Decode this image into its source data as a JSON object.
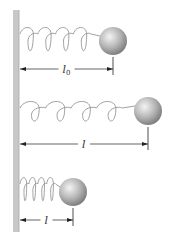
{
  "figure": {
    "colors": {
      "wall": "#c8c8c8",
      "wall_edge": "#a0a0a0",
      "spring": "#8a8a8a",
      "ball_light": "#f2f2f2",
      "ball_dark": "#7a7a7a",
      "dimension_line": "#222222"
    },
    "panels": [
      {
        "name": "natural-length",
        "label": "l",
        "label_subscript": "0",
        "spring_start_x": 20,
        "spring_end_x": 100,
        "spring_top_y": 28,
        "loops": 4,
        "ball_cx": 113,
        "ball_cy": 41,
        "dim_y": 69
      },
      {
        "name": "stretched",
        "label": "l",
        "label_subscript": "",
        "spring_start_x": 20,
        "spring_end_x": 135,
        "spring_top_y": 102,
        "loops": 4,
        "ball_cx": 148,
        "ball_cy": 111,
        "dim_y": 144
      },
      {
        "name": "compressed",
        "label": "l",
        "label_subscript": "",
        "spring_start_x": 20,
        "spring_end_x": 60,
        "spring_top_y": 178,
        "loops": 4,
        "ball_cx": 73,
        "ball_cy": 192,
        "dim_y": 220
      }
    ]
  }
}
